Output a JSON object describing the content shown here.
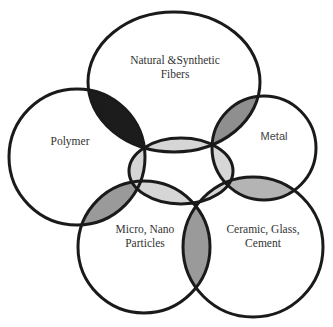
{
  "diagram": {
    "type": "venn-like overlapping material domains",
    "colors": {
      "stroke": "#1a1a1a",
      "background": "#ffffff",
      "fibers_polymer_overlap": "#1c1c1c",
      "outer_overlap_medium": "#9a9a9a",
      "center_overlap_light": "#d6d6d6"
    },
    "sets": [
      {
        "id": "fibers",
        "label_lines": [
          "Natural &Synthetic",
          "Fibers"
        ]
      },
      {
        "id": "polymer",
        "label_lines": [
          "Polymer"
        ]
      },
      {
        "id": "metal",
        "label_lines": [
          "Metal"
        ]
      },
      {
        "id": "micro",
        "label_lines": [
          "Micro, Nano",
          "Particles"
        ]
      },
      {
        "id": "ceramic",
        "label_lines": [
          "Ceramic, Glass,",
          "Cement"
        ]
      }
    ],
    "overlaps": [
      {
        "between": [
          "fibers",
          "polymer"
        ],
        "shade": "dark"
      },
      {
        "between": [
          "fibers",
          "metal"
        ],
        "shade": "medium"
      },
      {
        "between": [
          "polymer",
          "micro"
        ],
        "shade": "medium"
      },
      {
        "between": [
          "micro",
          "ceramic"
        ],
        "shade": "medium"
      },
      {
        "between": [
          "metal",
          "ceramic"
        ],
        "shade": "medium-light"
      },
      {
        "between": [
          "center",
          "fibers"
        ],
        "shade": "light"
      },
      {
        "between": [
          "center",
          "polymer"
        ],
        "shade": "light"
      },
      {
        "between": [
          "center",
          "metal"
        ],
        "shade": "light"
      },
      {
        "between": [
          "center",
          "micro"
        ],
        "shade": "light"
      },
      {
        "between": [
          "center",
          "ceramic"
        ],
        "shade": "light"
      }
    ]
  }
}
